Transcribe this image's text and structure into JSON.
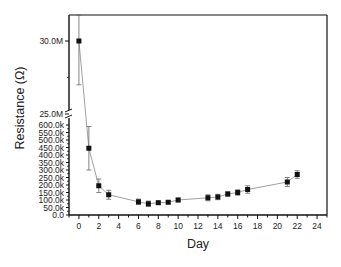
{
  "chart_data": {
    "type": "line",
    "title": "",
    "xlabel": "Day",
    "ylabel": "Resistance (Ω)",
    "xlim": [
      -1,
      25
    ],
    "x_ticks": [
      0,
      2,
      4,
      6,
      8,
      10,
      12,
      14,
      16,
      18,
      20,
      22,
      24
    ],
    "y_axis_broken": true,
    "y_segments": [
      {
        "range": [
          0,
          600000
        ],
        "tick_labels": [
          "0.0",
          "50.0k",
          "100.0k",
          "150.0k",
          "200.0k",
          "250.0k",
          "300.0k",
          "350.0k",
          "400.0k",
          "450.0k",
          "500.0k",
          "550.0k",
          "600.0k"
        ]
      },
      {
        "range": [
          25000000,
          31700000
        ],
        "tick_labels": [
          "25.0M",
          "30.0M"
        ]
      }
    ],
    "grid": false,
    "legend": null,
    "series": [
      {
        "name": "Resistance",
        "x": [
          0,
          1,
          2,
          3,
          6,
          7,
          8,
          9,
          10,
          13,
          14,
          15,
          16,
          17,
          21,
          22
        ],
        "values": [
          30000000,
          445000,
          195000,
          135000,
          88000,
          75000,
          82000,
          85000,
          100000,
          115000,
          120000,
          140000,
          150000,
          170000,
          220000,
          270000
        ],
        "error": [
          3000000,
          145000,
          45000,
          30000,
          18000,
          18000,
          10000,
          10000,
          12000,
          20000,
          18000,
          15000,
          18000,
          25000,
          30000,
          25000
        ]
      }
    ]
  },
  "labels": {
    "xlabel": "Day",
    "ylabel": "Resistance (Ω)"
  }
}
